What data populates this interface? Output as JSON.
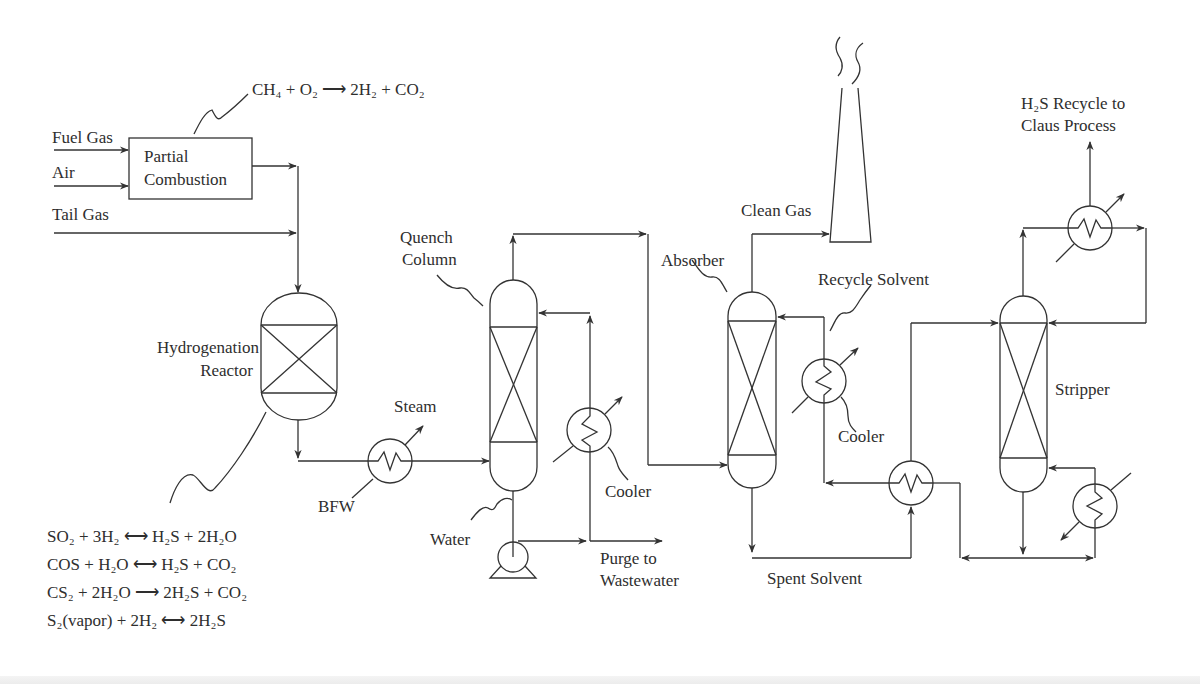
{
  "diagram": {
    "inputs": {
      "fuel_gas": "Fuel Gas",
      "air": "Air",
      "tail_gas": "Tail Gas"
    },
    "units": {
      "partial_combustion": "Partial Combustion",
      "partial_combustion_line1": "Partial",
      "partial_combustion_line2": "Combustion",
      "hydrogenation_reactor_line1": "Hydrogenation",
      "hydrogenation_reactor_line2": "Reactor",
      "quench_column_line1": "Quench",
      "quench_column_line2": "Column",
      "absorber": "Absorber",
      "stripper": "Stripper"
    },
    "streams": {
      "steam": "Steam",
      "bfw": "BFW",
      "water": "Water",
      "purge_line1": "Purge to",
      "purge_line2": "Wastewater",
      "clean_gas": "Clean Gas",
      "recycle_solvent": "Recycle Solvent",
      "spent_solvent": "Spent Solvent",
      "h2s_recycle_line1": "H₂S Recycle to",
      "h2s_recycle_line2": "Claus Process"
    },
    "equipment_labels": {
      "quench_cooler": "Cooler",
      "solvent_cooler": "Cooler"
    },
    "reactions": {
      "partial_combustion": "CH₄ + O₂ ⟶ 2H₂ + CO₂",
      "hydrogenation": [
        "SO₂ + 3H₂ ⟷ H₂S + 2H₂O",
        "COS + H₂O ⟷ H₂S + CO₂",
        "CS₂ + 2H₂O ⟶ 2H₂S + CO₂",
        "S₂(vapor) + 2H₂ ⟷ 2H₂S"
      ]
    },
    "colors": {
      "line": "#333333",
      "text": "#2e2e2e",
      "background": "#ffffff"
    }
  }
}
